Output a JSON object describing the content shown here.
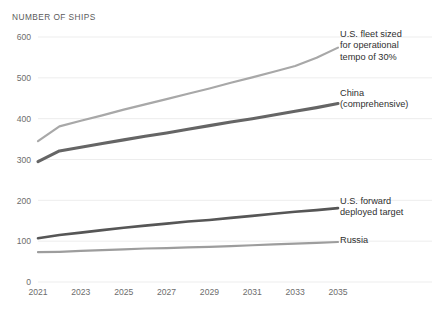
{
  "chart": {
    "title": "NUMBER OF SHIPS"
  },
  "chart_data": {
    "type": "line",
    "title": "NUMBER OF SHIPS",
    "subtitle": "",
    "xlabel": "",
    "ylabel": "NUMBER OF SHIPS",
    "grid": true,
    "legend_position": "right-inline-labels",
    "xlim": [
      2021,
      2035
    ],
    "ylim": [
      0,
      600
    ],
    "yticks": [
      0,
      100,
      200,
      300,
      400,
      500,
      600
    ],
    "xticks": [
      2021,
      2023,
      2025,
      2027,
      2029,
      2031,
      2033,
      2035
    ],
    "xtick_labels": [
      "2021",
      "2023",
      "2025",
      "2027",
      "2029",
      "2031",
      "2033",
      "2035"
    ],
    "ytick_labels": [
      "0",
      "100",
      "200",
      "300",
      "400",
      "500",
      "600"
    ],
    "x": [
      2021,
      2022,
      2023,
      2024,
      2025,
      2026,
      2027,
      2028,
      2029,
      2030,
      2031,
      2032,
      2033,
      2034,
      2035
    ],
    "series": [
      {
        "name": "U.S. fleet sized for operational tempo of 30%",
        "color": "#a8a8a8",
        "width": 2.2,
        "values": [
          345,
          381,
          395,
          408,
          422,
          435,
          448,
          461,
          474,
          488,
          501,
          515,
          529,
          549,
          574
        ]
      },
      {
        "name": "China (comprehensive)",
        "color": "#656565",
        "width": 3.1,
        "values": [
          295,
          321,
          330,
          339,
          348,
          357,
          365,
          374,
          383,
          392,
          400,
          409,
          418,
          427,
          437
        ]
      },
      {
        "name": "U.S. forward deployed target",
        "color": "#565656",
        "width": 2.6,
        "values": [
          107,
          115,
          121,
          127,
          133,
          138,
          143,
          148,
          152,
          157,
          162,
          167,
          172,
          176,
          181
        ]
      },
      {
        "name": "Russia",
        "color": "#9d9d9d",
        "width": 2.2,
        "values": [
          73,
          74,
          76,
          78,
          80,
          82,
          83,
          85,
          86,
          88,
          90,
          92,
          94,
          96,
          98
        ]
      }
    ],
    "annotations": [
      {
        "text": "U.S. fleet sized for operational tempo of 30%",
        "lines": [
          "U.S. fleet sized",
          "for operational",
          "tempo of 30%"
        ]
      },
      {
        "text": "China (comprehensive)",
        "lines": [
          "China",
          "(comprehensive)"
        ]
      },
      {
        "text": "U.S. forward deployed target",
        "lines": [
          "U.S. forward",
          "deployed target"
        ]
      },
      {
        "text": "Russia",
        "lines": [
          "Russia"
        ]
      }
    ]
  },
  "labels": {
    "us_fleet_line1": "U.S. fleet sized",
    "us_fleet_line2": "for operational",
    "us_fleet_line3": "tempo of 30%",
    "china_line1": "China",
    "china_line2": "(comprehensive)",
    "us_fwd_line1": "U.S. forward",
    "us_fwd_line2": "deployed target",
    "russia_line1": "Russia"
  },
  "colors": {
    "us_fleet": "#a8a8a8",
    "china": "#656565",
    "us_fwd": "#565656",
    "russia": "#9d9d9d",
    "grid": "#ededed",
    "text": "#4a4a4a"
  }
}
